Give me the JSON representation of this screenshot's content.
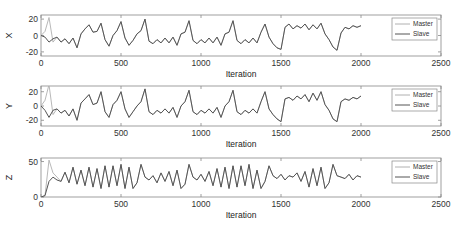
{
  "chart_data": [
    {
      "type": "line",
      "ylabel": "X",
      "xlabel": "Iteration",
      "xlim": [
        0,
        2500
      ],
      "ylim": [
        -25,
        25
      ],
      "xticks": [
        "0",
        "500",
        "1000",
        "1500",
        "2000",
        "2500"
      ],
      "yticks": [
        "20",
        "0",
        "-20"
      ],
      "ytick_values": [
        20,
        0,
        -20
      ],
      "legend": [
        "Master",
        "Slave"
      ],
      "legend_position": "northeast",
      "x": [
        0,
        25,
        50,
        75,
        100,
        125,
        150,
        175,
        200,
        225,
        250,
        275,
        300,
        325,
        350,
        375,
        400,
        425,
        450,
        475,
        500,
        525,
        550,
        575,
        600,
        625,
        650,
        675,
        700,
        725,
        750,
        775,
        800,
        825,
        850,
        875,
        900,
        925,
        950,
        975,
        1000,
        1025,
        1050,
        1075,
        1100,
        1125,
        1150,
        1175,
        1200,
        1225,
        1250,
        1275,
        1300,
        1325,
        1350,
        1375,
        1400,
        1425,
        1450,
        1475,
        1500,
        1525,
        1550,
        1575,
        1600,
        1625,
        1650,
        1675,
        1700,
        1725,
        1750,
        1775,
        1800,
        1825,
        1850,
        1875,
        1900,
        1925,
        1950,
        1975,
        2000
      ],
      "series": [
        {
          "name": "Master",
          "color": "#b0b0b0",
          "values": [
            0,
            5,
            22,
            -8,
            -2,
            -8,
            -4,
            -10,
            -3,
            -15,
            2,
            8,
            13,
            4,
            5,
            15,
            -5,
            -13,
            0,
            6,
            17,
            -3,
            -12,
            -6,
            2,
            6,
            20,
            -7,
            -10,
            -5,
            -9,
            -3,
            -9,
            -2,
            -12,
            2,
            4,
            18,
            -6,
            -10,
            -5,
            -9,
            -3,
            -9,
            -2,
            -12,
            2,
            4,
            18,
            -6,
            -10,
            -5,
            -9,
            -3,
            -9,
            4,
            14,
            -2,
            -10,
            -15,
            -17,
            10,
            14,
            8,
            12,
            9,
            14,
            7,
            13,
            8,
            15,
            2,
            -5,
            -14,
            -18,
            3,
            10,
            8,
            12,
            10,
            12
          ]
        },
        {
          "name": "Slave",
          "color": "#555555",
          "values": [
            0,
            -2,
            -8,
            -4,
            -2,
            -8,
            -4,
            -10,
            -3,
            -15,
            2,
            8,
            13,
            4,
            5,
            15,
            -5,
            -13,
            0,
            6,
            17,
            -3,
            -12,
            -6,
            2,
            6,
            20,
            -7,
            -10,
            -5,
            -9,
            -3,
            -9,
            -2,
            -12,
            2,
            4,
            18,
            -6,
            -10,
            -5,
            -9,
            -3,
            -9,
            -2,
            -12,
            2,
            4,
            18,
            -6,
            -10,
            -5,
            -9,
            -3,
            -9,
            4,
            14,
            -2,
            -10,
            -15,
            -17,
            10,
            14,
            8,
            12,
            9,
            14,
            7,
            13,
            8,
            15,
            2,
            -5,
            -14,
            -18,
            3,
            10,
            8,
            12,
            10,
            12
          ]
        }
      ]
    },
    {
      "type": "line",
      "ylabel": "Y",
      "xlabel": "Iteration",
      "xlim": [
        0,
        2500
      ],
      "ylim": [
        -28,
        28
      ],
      "xticks": [
        "0",
        "500",
        "1000",
        "1500",
        "2000",
        "2500"
      ],
      "yticks": [
        "20",
        "0",
        "-20"
      ],
      "ytick_values": [
        20,
        0,
        -20
      ],
      "legend": [
        "Master",
        "Slave"
      ],
      "legend_position": "northeast",
      "x": [
        0,
        25,
        50,
        75,
        100,
        125,
        150,
        175,
        200,
        225,
        250,
        275,
        300,
        325,
        350,
        375,
        400,
        425,
        450,
        475,
        500,
        525,
        550,
        575,
        600,
        625,
        650,
        675,
        700,
        725,
        750,
        775,
        800,
        825,
        850,
        875,
        900,
        925,
        950,
        975,
        1000,
        1025,
        1050,
        1075,
        1100,
        1125,
        1150,
        1175,
        1200,
        1225,
        1250,
        1275,
        1300,
        1325,
        1350,
        1375,
        1400,
        1425,
        1450,
        1475,
        1500,
        1525,
        1550,
        1575,
        1600,
        1625,
        1650,
        1675,
        1700,
        1725,
        1750,
        1775,
        1800,
        1825,
        1850,
        1875,
        1900,
        1925,
        1950,
        1975,
        2000
      ],
      "series": [
        {
          "name": "Master",
          "color": "#b0b0b0",
          "values": [
            0,
            8,
            30,
            -12,
            -4,
            -10,
            -6,
            -14,
            -4,
            -20,
            4,
            10,
            16,
            2,
            4,
            20,
            -8,
            -16,
            2,
            8,
            20,
            -4,
            -16,
            -8,
            0,
            6,
            24,
            -8,
            -12,
            -6,
            -10,
            -4,
            -10,
            -2,
            -16,
            0,
            6,
            22,
            -8,
            -12,
            -6,
            -10,
            -4,
            -10,
            -2,
            -16,
            0,
            6,
            22,
            -8,
            -12,
            -6,
            -10,
            -4,
            -10,
            6,
            20,
            -4,
            -12,
            -18,
            -22,
            10,
            12,
            8,
            14,
            10,
            16,
            6,
            18,
            8,
            20,
            2,
            -6,
            -18,
            -22,
            6,
            10,
            8,
            12,
            10,
            14
          ]
        },
        {
          "name": "Slave",
          "color": "#555555",
          "values": [
            0,
            -6,
            -16,
            -6,
            -4,
            -10,
            -6,
            -14,
            -4,
            -20,
            4,
            10,
            16,
            2,
            4,
            20,
            -8,
            -16,
            2,
            8,
            20,
            -4,
            -16,
            -8,
            0,
            6,
            24,
            -8,
            -12,
            -6,
            -10,
            -4,
            -10,
            -2,
            -16,
            0,
            6,
            22,
            -8,
            -12,
            -6,
            -10,
            -4,
            -10,
            -2,
            -16,
            0,
            6,
            22,
            -8,
            -12,
            -6,
            -10,
            -4,
            -10,
            6,
            20,
            -4,
            -12,
            -18,
            -22,
            10,
            12,
            8,
            14,
            10,
            16,
            6,
            18,
            8,
            20,
            2,
            -6,
            -18,
            -22,
            6,
            10,
            8,
            12,
            10,
            14
          ]
        }
      ]
    },
    {
      "type": "line",
      "ylabel": "Z",
      "xlabel": "Iteration",
      "xlim": [
        0,
        2500
      ],
      "ylim": [
        0,
        55
      ],
      "xticks": [
        "0",
        "500",
        "1000",
        "1500",
        "2000",
        "2500"
      ],
      "yticks": [
        "50",
        "0"
      ],
      "ytick_values": [
        50,
        0
      ],
      "legend": [
        "Master",
        "Slave"
      ],
      "legend_position": "northeast",
      "x": [
        0,
        25,
        50,
        75,
        100,
        125,
        150,
        175,
        200,
        225,
        250,
        275,
        300,
        325,
        350,
        375,
        400,
        425,
        450,
        475,
        500,
        525,
        550,
        575,
        600,
        625,
        650,
        675,
        700,
        725,
        750,
        775,
        800,
        825,
        850,
        875,
        900,
        925,
        950,
        975,
        1000,
        1025,
        1050,
        1075,
        1100,
        1125,
        1150,
        1175,
        1200,
        1225,
        1250,
        1275,
        1300,
        1325,
        1350,
        1375,
        1400,
        1425,
        1450,
        1475,
        1500,
        1525,
        1550,
        1575,
        1600,
        1625,
        1650,
        1675,
        1700,
        1725,
        1750,
        1775,
        1800,
        1825,
        1850,
        1875,
        1900,
        1925,
        1950,
        1975,
        2000
      ],
      "series": [
        {
          "name": "Master",
          "color": "#b0b0b0",
          "values": [
            0,
            2,
            52,
            34,
            28,
            22,
            35,
            20,
            42,
            18,
            38,
            16,
            42,
            14,
            40,
            12,
            44,
            14,
            44,
            16,
            46,
            12,
            42,
            12,
            20,
            46,
            28,
            24,
            30,
            20,
            34,
            22,
            36,
            16,
            38,
            12,
            18,
            46,
            28,
            24,
            32,
            22,
            36,
            16,
            40,
            14,
            42,
            12,
            44,
            14,
            44,
            16,
            46,
            12,
            38,
            12,
            22,
            44,
            30,
            26,
            32,
            24,
            30,
            28,
            34,
            22,
            36,
            14,
            40,
            16,
            42,
            12,
            20,
            46,
            30,
            28,
            26,
            32,
            24,
            30,
            28
          ]
        },
        {
          "name": "Slave",
          "color": "#555555",
          "values": [
            0,
            2,
            22,
            28,
            24,
            22,
            35,
            20,
            42,
            18,
            38,
            16,
            42,
            14,
            40,
            12,
            44,
            14,
            44,
            16,
            46,
            12,
            42,
            12,
            20,
            46,
            28,
            24,
            30,
            20,
            34,
            22,
            36,
            16,
            38,
            12,
            18,
            46,
            28,
            24,
            32,
            22,
            36,
            16,
            40,
            14,
            42,
            12,
            44,
            14,
            44,
            16,
            46,
            12,
            38,
            12,
            22,
            44,
            30,
            26,
            32,
            24,
            30,
            28,
            34,
            22,
            36,
            14,
            40,
            16,
            42,
            12,
            20,
            46,
            30,
            28,
            26,
            32,
            24,
            30,
            28
          ]
        }
      ]
    }
  ],
  "panels": [
    {
      "ylabel": "X",
      "xlabel": "Iteration",
      "legend": {
        "master": "Master",
        "slave": "Slave"
      }
    },
    {
      "ylabel": "Y",
      "xlabel": "Iteration",
      "legend": {
        "master": "Master",
        "slave": "Slave"
      }
    },
    {
      "ylabel": "Z",
      "xlabel": "Iteration",
      "legend": {
        "master": "Master",
        "slave": "Slave"
      }
    }
  ],
  "colors": {
    "axis": "#888888",
    "master": "#b0b0b0",
    "slave": "#555555"
  }
}
